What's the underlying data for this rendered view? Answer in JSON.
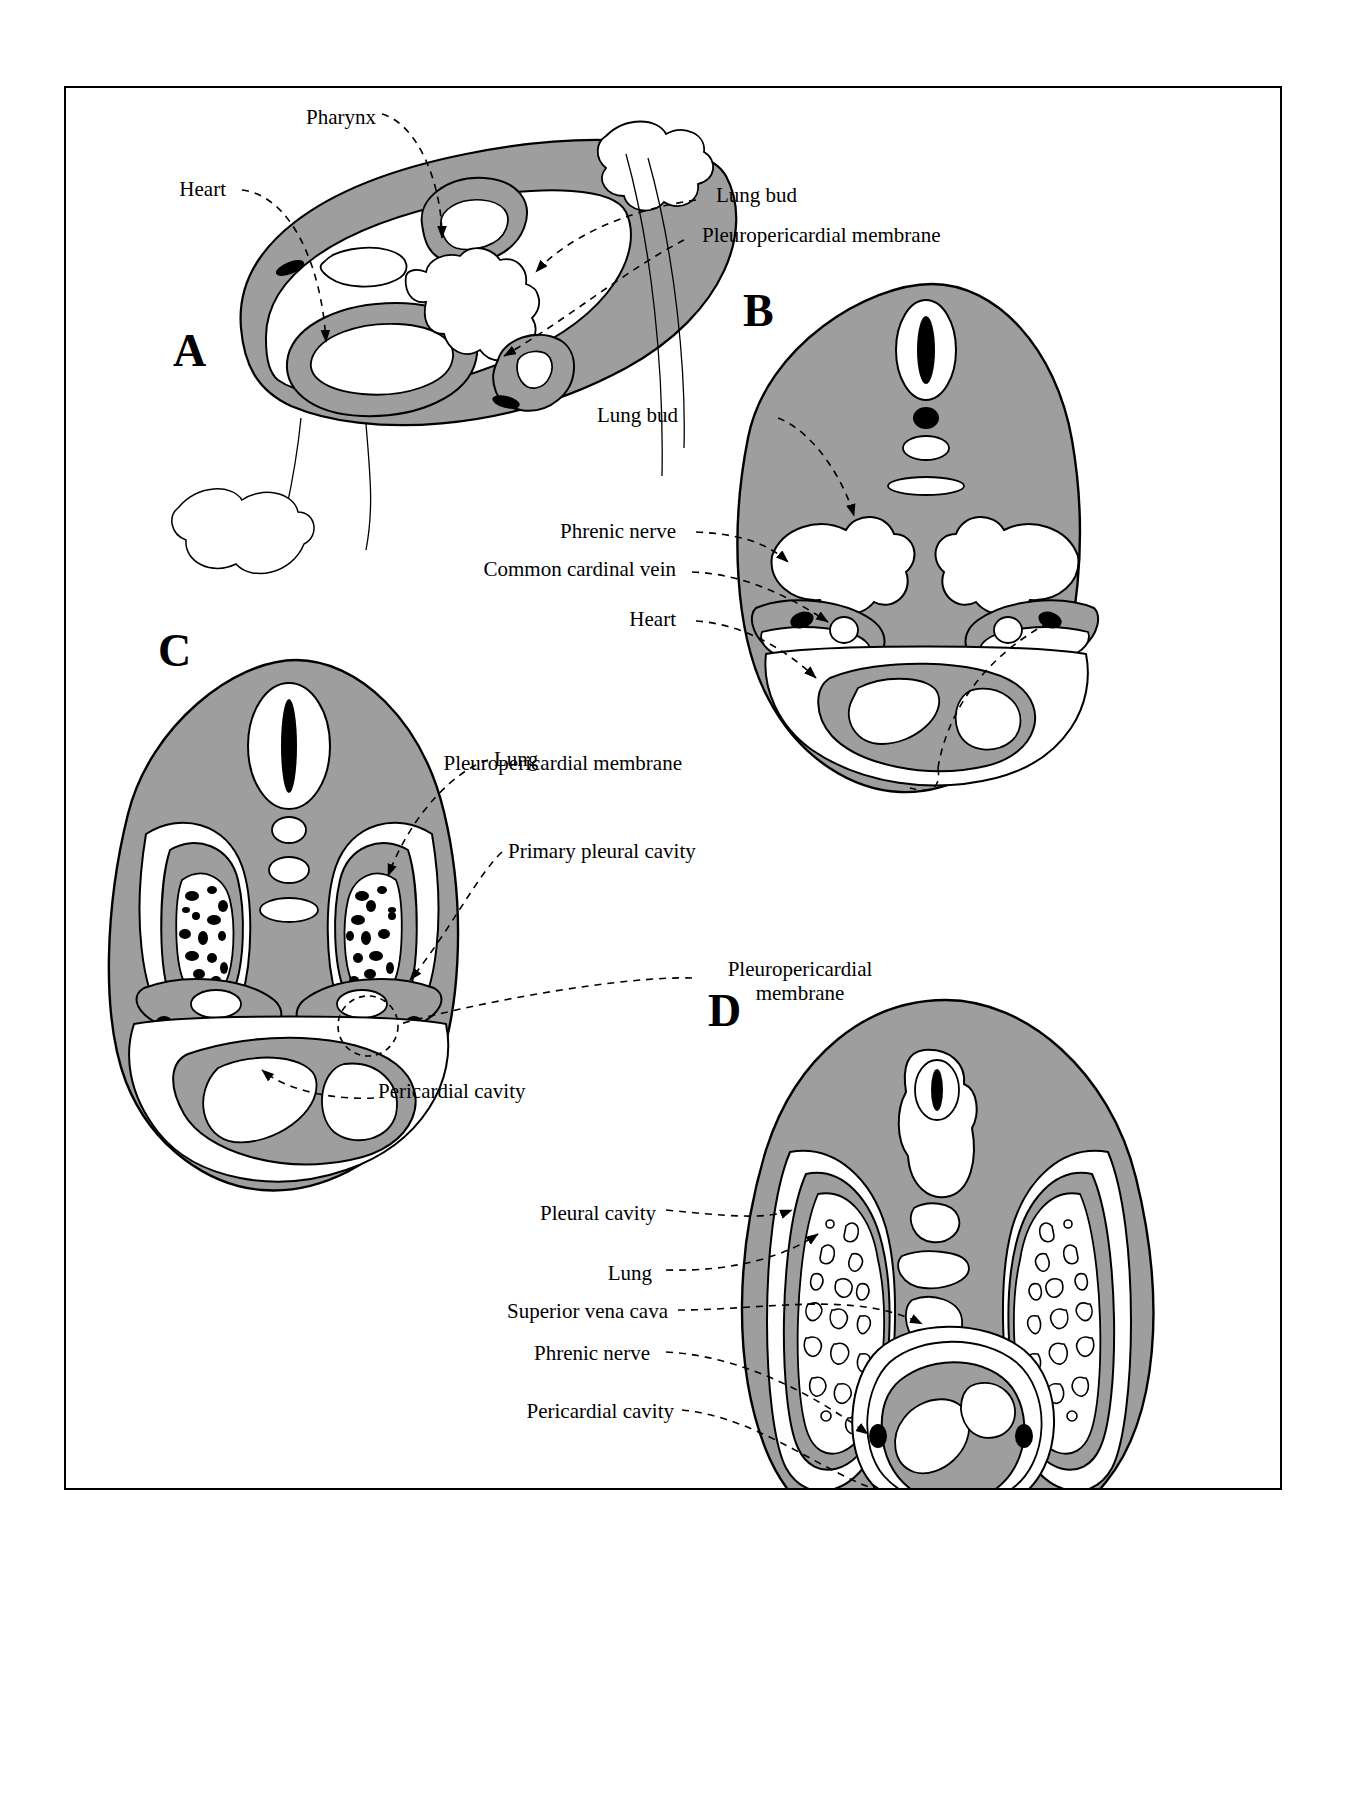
{
  "figure": {
    "domain": "diagram",
    "background_color": "#ffffff",
    "frame_color": "#000000",
    "mesenchyme_fill": "#9e9e9e",
    "cavity_fill": "#ffffff",
    "solid_structure_fill": "#000000",
    "outline_color": "#000000",
    "leader_line_style": "dashed"
  },
  "panels": [
    {
      "id": "A",
      "letter": "A",
      "letter_pos": {
        "x": 115,
        "y": 265
      },
      "description": "Oblique view of embryonic thorax showing pharynx, heart, lung buds and pleuropericardial membranes",
      "labels": [
        {
          "key": "pharynx",
          "text": "Pharynx",
          "x": 245,
          "y": 25,
          "align": "right"
        },
        {
          "key": "heart",
          "text": "Heart",
          "x": 125,
          "y": 97,
          "align": "right"
        },
        {
          "key": "lung_bud",
          "text": "Lung bud",
          "x": 650,
          "y": 105,
          "align": "left"
        },
        {
          "key": "pleuropericardial_membrane",
          "text": "Pleuropericardial membrane",
          "x": 636,
          "y": 145,
          "align": "left"
        }
      ]
    },
    {
      "id": "B",
      "letter": "B",
      "letter_pos": {
        "x": 686,
        "y": 220
      },
      "description": "Transverse section: lung buds enlarging, pleuropericardial membranes with phrenic nerve and common cardinal vein",
      "labels": [
        {
          "key": "lung_bud",
          "text": "Lung bud",
          "x": 602,
          "y": 324,
          "align": "right"
        },
        {
          "key": "phrenic_nerve",
          "text": "Phrenic nerve",
          "x": 517,
          "y": 440,
          "align": "right"
        },
        {
          "key": "common_cardinal_vein",
          "text": "Common cardinal vein",
          "x": 434,
          "y": 477,
          "align": "right"
        },
        {
          "key": "heart",
          "text": "Heart",
          "x": 583,
          "y": 528,
          "align": "right"
        },
        {
          "key": "pleuropericardial_membrane",
          "text": "Pleuropericardial membrane",
          "x": 625,
          "y": 675,
          "align": "right"
        }
      ]
    },
    {
      "id": "C",
      "letter": "C",
      "letter_pos": {
        "x": 100,
        "y": 557
      },
      "description": "Transverse section: lungs expanded into primary pleural cavities, pleuropericardial membranes forming, pericardial cavity below",
      "labels": [
        {
          "key": "lung",
          "text": "Lung",
          "x": 425,
          "y": 667,
          "align": "left"
        },
        {
          "key": "primary_pleural_cavity",
          "text": "Primary pleural cavity",
          "x": 440,
          "y": 759,
          "align": "left"
        },
        {
          "key": "pleuropericardial_membrane",
          "text": "Pleuropericardial\nmembrane",
          "x": 633,
          "y": 880,
          "align": "left",
          "two_line": true,
          "line1": "Pleuropericardial",
          "line2": "membrane"
        },
        {
          "key": "pericardial_cavity",
          "text": "Pericardial cavity",
          "x": 310,
          "y": 1000,
          "align": "left"
        }
      ]
    },
    {
      "id": "D",
      "letter": "D",
      "letter_pos": {
        "x": 650,
        "y": 920
      },
      "description": "Transverse section: definitive pleural cavities, lungs, superior vena cava, phrenic nerves in fibrous pericardium, pericardial cavity",
      "labels": [
        {
          "key": "pleural_cavity",
          "text": "Pleural cavity",
          "x": 590,
          "y": 1122,
          "align": "right"
        },
        {
          "key": "lung",
          "text": "Lung",
          "x": 583,
          "y": 1182,
          "align": "right"
        },
        {
          "key": "superior_vena_cava",
          "text": "Superior vena cava",
          "x": 600,
          "y": 1220,
          "align": "right"
        },
        {
          "key": "phrenic_nerve",
          "text": "Phrenic nerve",
          "x": 583,
          "y": 1262,
          "align": "right"
        },
        {
          "key": "pericardial_cavity",
          "text": "Pericardial cavity",
          "x": 605,
          "y": 1320,
          "align": "right"
        }
      ]
    }
  ],
  "all_label_terms": [
    "Pharynx",
    "Heart",
    "Lung bud",
    "Pleuropericardial membrane",
    "Phrenic nerve",
    "Common cardinal vein",
    "Lung",
    "Primary pleural cavity",
    "Pericardial cavity",
    "Pleural cavity",
    "Superior vena cava"
  ]
}
